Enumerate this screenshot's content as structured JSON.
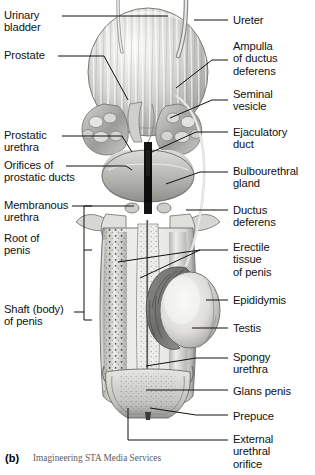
{
  "figure": {
    "panel_letter": "(b)",
    "credit": "Imagineering STA Media Services",
    "colors": {
      "ink": "#111111",
      "tissue_light": "#e8e8e6",
      "tissue_mid": "#b9b9b6",
      "tissue_dark": "#7d7d7a",
      "outline": "#6a6a67",
      "background": "#ffffff"
    }
  },
  "labels_left": [
    {
      "id": "urinary-bladder",
      "text": "Urinary\nbladder",
      "x": 4,
      "y": 9
    },
    {
      "id": "prostate",
      "text": "Prostate",
      "x": 4,
      "y": 49
    },
    {
      "id": "prostatic-urethra",
      "text": "Prostatic\nurethra",
      "x": 4,
      "y": 129
    },
    {
      "id": "orifices-prostatic",
      "text": "Orifices of\nprostatic ducts",
      "x": 4,
      "y": 159
    },
    {
      "id": "membranous-urethra",
      "text": "Membranous\nurethra",
      "x": 4,
      "y": 199
    },
    {
      "id": "root-of-penis",
      "text": "Root of\npenis",
      "x": 4,
      "y": 232
    },
    {
      "id": "shaft-of-penis",
      "text": "Shaft (body)\nof penis",
      "x": 4,
      "y": 303
    }
  ],
  "labels_right": [
    {
      "id": "ureter",
      "text": "Ureter",
      "x": 233,
      "y": 14
    },
    {
      "id": "ampulla-ductus",
      "text": "Ampulla\nof ductus\ndeferens",
      "x": 233,
      "y": 40
    },
    {
      "id": "seminal-vesicle",
      "text": "Seminal\nvesicle",
      "x": 233,
      "y": 88
    },
    {
      "id": "ejaculatory-duct",
      "text": "Ejaculatory\nduct",
      "x": 233,
      "y": 126
    },
    {
      "id": "bulbourethral-gland",
      "text": "Bulbourethral\ngland",
      "x": 233,
      "y": 165
    },
    {
      "id": "ductus-deferens",
      "text": "Ductus\ndeferens",
      "x": 233,
      "y": 204
    },
    {
      "id": "erectile-tissue",
      "text": "Erectile\ntissue\nof penis",
      "x": 233,
      "y": 241
    },
    {
      "id": "epididymis",
      "text": "Epididymis",
      "x": 233,
      "y": 294
    },
    {
      "id": "testis",
      "text": "Testis",
      "x": 233,
      "y": 322
    },
    {
      "id": "spongy-urethra",
      "text": "Spongy\nurethra",
      "x": 233,
      "y": 351
    },
    {
      "id": "glans-penis",
      "text": "Glans penis",
      "x": 233,
      "y": 385
    },
    {
      "id": "prepuce",
      "text": "Prepuce",
      "x": 233,
      "y": 410
    },
    {
      "id": "external-orifice",
      "text": "External\nurethral\norifice",
      "x": 233,
      "y": 433
    }
  ],
  "leader_lines": {
    "left": [
      {
        "id": "leader-urinary-bladder",
        "d": "M62,16 L168,16"
      },
      {
        "id": "leader-prostate",
        "d": "M58,56 L104,56 L128,100"
      },
      {
        "id": "leader-prostatic-urethra",
        "d": "M62,136 L122,136 L132,152"
      },
      {
        "id": "leader-orifices",
        "d": "M66,166 L126,166 L132,170"
      },
      {
        "id": "leader-membranous-urethra",
        "d": "M72,206 L134,206"
      }
    ],
    "right": [
      {
        "id": "leader-ureter",
        "d": "M228,20 L194,20"
      },
      {
        "id": "leader-ampulla",
        "d": "M228,60 L212,60 L176,88"
      },
      {
        "id": "leader-seminal-vesicle",
        "d": "M228,100 L212,100 L170,118"
      },
      {
        "id": "leader-ejaculatory-duct",
        "d": "M228,132 L196,132 L152,152"
      },
      {
        "id": "leader-bulbourethral-gland",
        "d": "M228,172 L200,172 L166,184"
      },
      {
        "id": "leader-ductus-deferens",
        "d": "M228,210 L186,210"
      },
      {
        "id": "leader-erectile-tissue",
        "d": "M228,250 L200,250 L118,262"
      },
      {
        "id": "leader-erectile-tissue-2",
        "d": "M200,250 L140,278"
      },
      {
        "id": "leader-epididymis",
        "d": "M228,300 L206,300"
      },
      {
        "id": "leader-testis",
        "d": "M228,328 L192,328"
      },
      {
        "id": "leader-spongy-urethra",
        "d": "M228,358 L196,358 L146,366"
      },
      {
        "id": "leader-glans-penis",
        "d": "M228,390 L146,390"
      },
      {
        "id": "leader-prepuce",
        "d": "M228,415 L196,415 L150,408"
      },
      {
        "id": "leader-external-orifice",
        "d": "M228,440 L128,440 L128,408"
      }
    ],
    "bracket": {
      "id": "bracket-penis-regions",
      "d": "M84,206 L84,320 M84,206 L92,206 M84,250 L92,250 M84,320 L92,320 M74,312 L84,312"
    }
  }
}
